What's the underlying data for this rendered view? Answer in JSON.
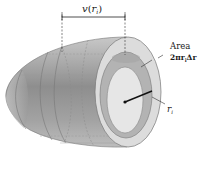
{
  "diagram": {
    "velocity_label": {
      "main": "v",
      "open": "(",
      "var": "r",
      "sub": "i",
      "close": ")"
    },
    "area_label": {
      "title": "Area",
      "formula": "2πr",
      "formula_sub": "i",
      "formula_tail": "Δr"
    },
    "radius_label": {
      "var": "r",
      "sub": "i"
    },
    "colors": {
      "body_dark": "#8f8f8f",
      "body_mid": "#a9a9a9",
      "body_light": "#c4c4c4",
      "outer_ring": "#dcdcdc",
      "area_ring": "#b3b3b3",
      "inner_disk": "#e6e6e6",
      "line": "#222222"
    }
  }
}
